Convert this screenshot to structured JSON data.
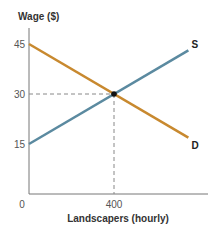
{
  "chart_data": {
    "type": "line",
    "title": "",
    "ylabel": "Wage ($)",
    "xlabel": "Landscapers (hourly)",
    "xlim": [
      0,
      840
    ],
    "ylim": [
      0,
      50
    ],
    "x_ticks": [
      {
        "value": 0,
        "label": "0"
      },
      {
        "value": 400,
        "label": "400"
      }
    ],
    "y_ticks": [
      {
        "value": 15,
        "label": "15"
      },
      {
        "value": 30,
        "label": "30"
      },
      {
        "value": 45,
        "label": "45"
      }
    ],
    "grid": false,
    "series": [
      {
        "name": "S",
        "label": "S",
        "color": "#5b8aa0",
        "points": [
          [
            0,
            15
          ],
          [
            750,
            43.1
          ]
        ]
      },
      {
        "name": "D",
        "label": "D",
        "color": "#c8892f",
        "points": [
          [
            0,
            45
          ],
          [
            750,
            16.9
          ]
        ]
      }
    ],
    "equilibrium": {
      "x": 400,
      "y": 30,
      "color": "#111111"
    },
    "reference_lines": {
      "style": "dashed",
      "color": "#888888"
    }
  }
}
